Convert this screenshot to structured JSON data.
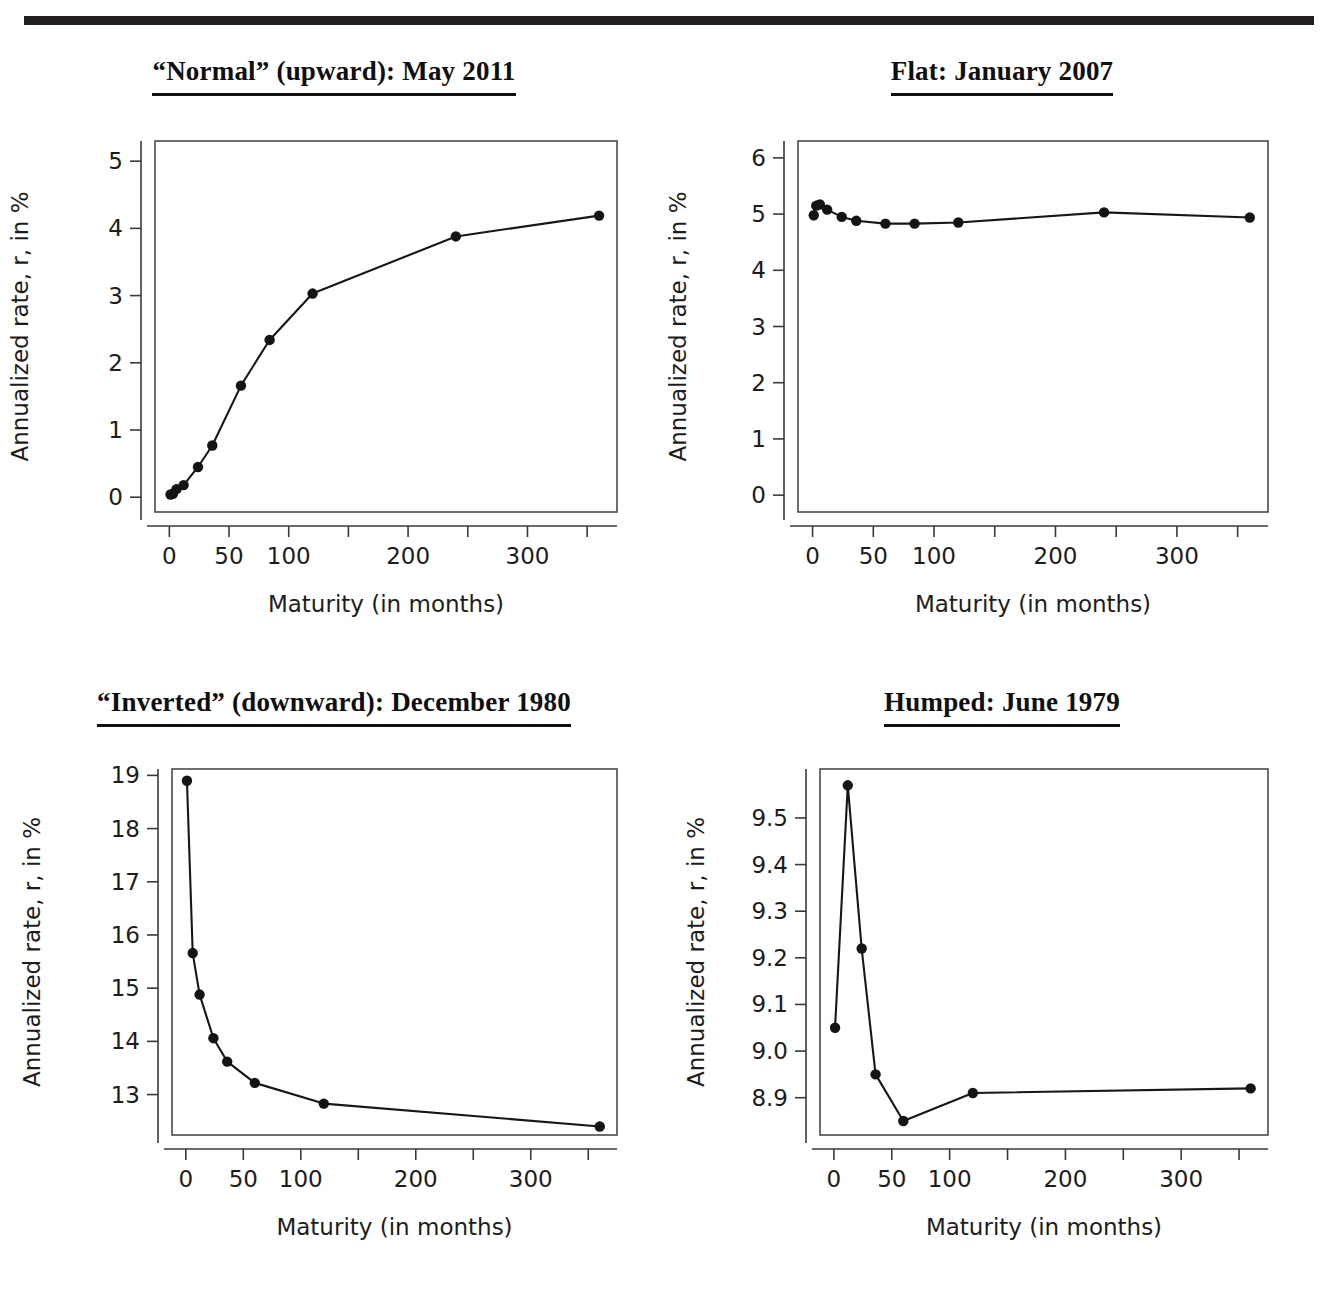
{
  "figure": {
    "top_rule": true,
    "axis_label_x": "Maturity (in months)",
    "axis_label_y": "Annualized rate, r, in %"
  },
  "panels": [
    {
      "id": "normal",
      "title": "“Normal” (upward): May 2011"
    },
    {
      "id": "flat",
      "title": "Flat: January 2007"
    },
    {
      "id": "inverted",
      "title": "“Inverted” (downward): December 1980"
    },
    {
      "id": "humped",
      "title": "Humped: June 1979"
    }
  ],
  "chart_data": [
    {
      "type": "line",
      "title": "“Normal” (upward): May 2011",
      "xlabel": "Maturity (in months)",
      "ylabel": "Annualized rate, r, in %",
      "x": [
        1,
        3,
        6,
        12,
        24,
        36,
        60,
        84,
        120,
        240,
        360
      ],
      "values": [
        0.04,
        0.05,
        0.12,
        0.18,
        0.45,
        0.77,
        1.66,
        2.34,
        3.03,
        3.88,
        4.19
      ],
      "xlim": [
        -12,
        375
      ],
      "ylim": [
        -0.22,
        5.3
      ],
      "xticks": [
        0,
        50,
        100,
        150,
        200,
        250,
        300,
        350
      ],
      "xticklabels": [
        "0",
        "50",
        "100",
        "",
        "200",
        "",
        "300",
        ""
      ],
      "yticks": [
        0,
        1,
        2,
        3,
        4,
        5
      ],
      "yticklabels": [
        "0",
        "1",
        "2",
        "3",
        "4",
        "5"
      ],
      "grid": false,
      "legend": "none",
      "marker": "filled-circle"
    },
    {
      "type": "line",
      "title": "Flat: January 2007",
      "xlabel": "Maturity (in months)",
      "ylabel": "Annualized rate, r, in %",
      "x": [
        1,
        3,
        6,
        12,
        24,
        36,
        60,
        84,
        120,
        240,
        360
      ],
      "values": [
        4.98,
        5.15,
        5.17,
        5.08,
        4.95,
        4.88,
        4.83,
        4.83,
        4.85,
        5.03,
        4.94
      ],
      "xlim": [
        -12,
        375
      ],
      "ylim": [
        -0.3,
        6.3
      ],
      "xticks": [
        0,
        50,
        100,
        150,
        200,
        250,
        300,
        350
      ],
      "xticklabels": [
        "0",
        "50",
        "100",
        "",
        "200",
        "",
        "300",
        ""
      ],
      "yticks": [
        0,
        1,
        2,
        3,
        4,
        5,
        6
      ],
      "yticklabels": [
        "0",
        "1",
        "2",
        "3",
        "4",
        "5",
        "6"
      ],
      "grid": false,
      "legend": "none",
      "marker": "filled-circle"
    },
    {
      "type": "line",
      "title": "“Inverted” (downward): December 1980",
      "xlabel": "Maturity (in months)",
      "ylabel": "Annualized rate, r, in %",
      "x": [
        1,
        6,
        12,
        24,
        36,
        60,
        120,
        360
      ],
      "values": [
        18.9,
        15.66,
        14.88,
        14.06,
        13.62,
        13.22,
        12.83,
        12.4
      ],
      "xlim": [
        -12,
        375
      ],
      "ylim": [
        12.24,
        19.12
      ],
      "xticks": [
        0,
        50,
        100,
        150,
        200,
        250,
        300,
        350
      ],
      "xticklabels": [
        "0",
        "50",
        "100",
        "",
        "200",
        "",
        "300",
        ""
      ],
      "yticks": [
        13,
        14,
        15,
        16,
        17,
        18,
        19
      ],
      "yticklabels": [
        "13",
        "14",
        "15",
        "16",
        "17",
        "18",
        "19"
      ],
      "grid": false,
      "legend": "none",
      "marker": "filled-circle"
    },
    {
      "type": "line",
      "title": "Humped: June 1979",
      "xlabel": "Maturity (in months)",
      "ylabel": "Annualized rate, r, in %",
      "x": [
        1,
        12,
        24,
        36,
        60,
        120,
        360
      ],
      "values": [
        9.05,
        9.57,
        9.22,
        8.95,
        8.85,
        8.91,
        8.92
      ],
      "xlim": [
        -12,
        375
      ],
      "ylim": [
        8.82,
        9.605
      ],
      "xticks": [
        0,
        50,
        100,
        150,
        200,
        250,
        300,
        350
      ],
      "xticklabels": [
        "0",
        "50",
        "100",
        "",
        "200",
        "",
        "300",
        ""
      ],
      "yticks": [
        8.9,
        9.0,
        9.1,
        9.2,
        9.3,
        9.4,
        9.5
      ],
      "yticklabels": [
        "8.9",
        "9.0",
        "9.1",
        "9.2",
        "9.3",
        "9.4",
        "9.5"
      ],
      "grid": false,
      "legend": "none",
      "marker": "filled-circle"
    }
  ]
}
